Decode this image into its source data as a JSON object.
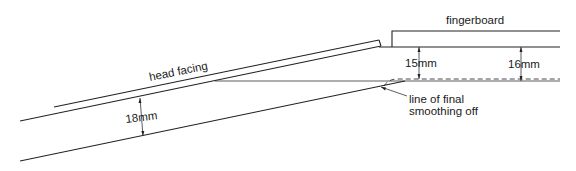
{
  "diagram": {
    "type": "cross-section",
    "labels": {
      "fingerboard": "fingerboard",
      "head_facing": "head facing",
      "thickness_head": "18mm",
      "thickness_neck_nut": "15mm",
      "thickness_neck_far": "16mm",
      "smoothing_line_1": "line of final",
      "smoothing_line_2": "smoothing off"
    },
    "colors": {
      "line": "#222222",
      "background": "#ffffff"
    }
  }
}
